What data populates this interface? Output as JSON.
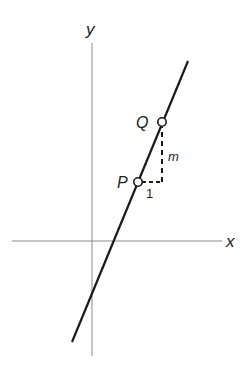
{
  "diagram": {
    "axes": {
      "x_label": "x",
      "y_label": "y",
      "color": "#8a8a8a"
    },
    "line": {
      "color": "#1a1a1a",
      "start": [
        72,
        342
      ],
      "end": [
        188,
        61
      ]
    },
    "points": [
      {
        "id": "P",
        "label": "P",
        "cx": 138,
        "cy": 182
      },
      {
        "id": "Q",
        "label": "Q",
        "cx": 162,
        "cy": 122
      }
    ],
    "run_label": "1",
    "rise_label": "m"
  }
}
